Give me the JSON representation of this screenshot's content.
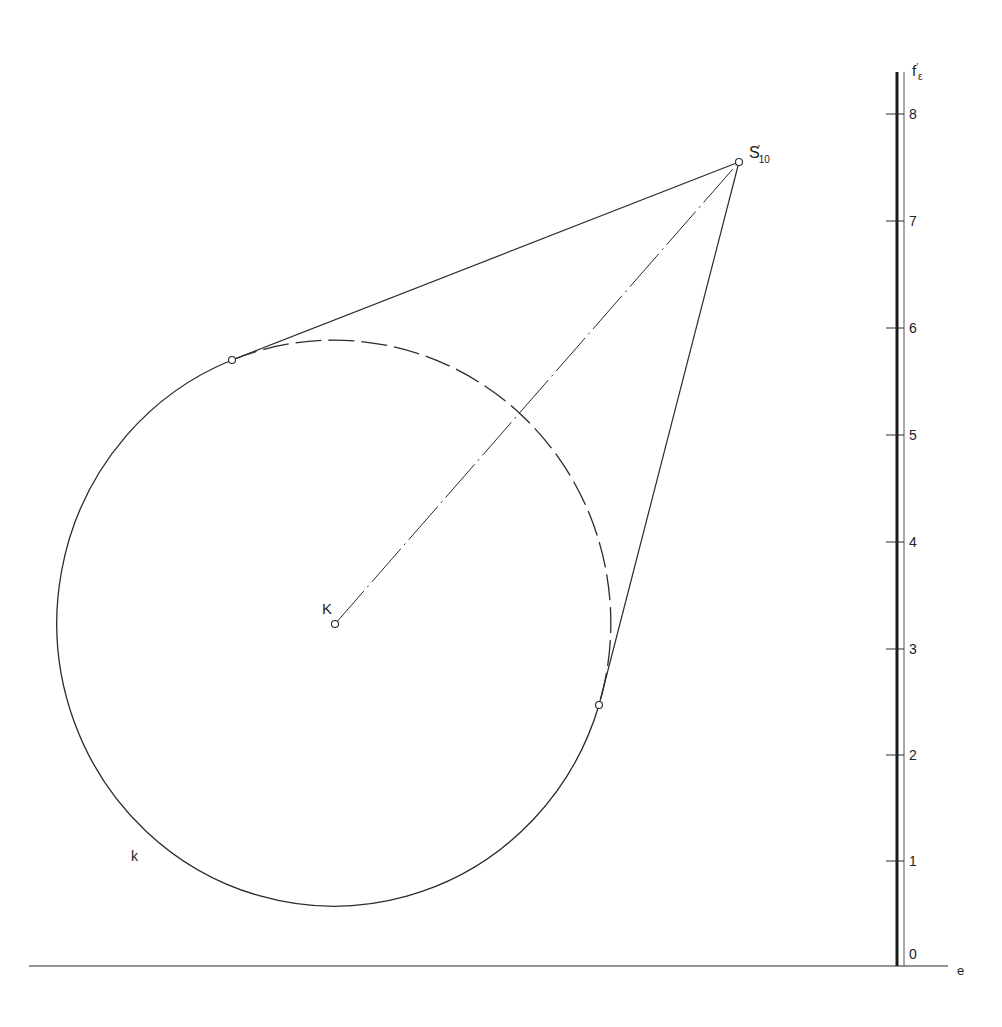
{
  "diagram": {
    "colors": {
      "line": "#2a2a2a",
      "background": "#ffffff"
    },
    "circle": {
      "label": "k",
      "center_label": "K",
      "cx": 335,
      "cy": 624,
      "rx": 277,
      "ry": 283
    },
    "apex": {
      "label_main": "S",
      "label_prime": "′",
      "label_sub": "10",
      "x": 739,
      "y": 162
    },
    "tangent_points": [
      {
        "x": 232,
        "y": 360
      },
      {
        "x": 599,
        "y": 705
      }
    ],
    "axis": {
      "label_main": "f",
      "label_prime": "′",
      "label_sub": "ε",
      "baseline_label": "e",
      "ticks": [
        {
          "value": "0",
          "y": 967
        },
        {
          "value": "1",
          "y": 861
        },
        {
          "value": "2",
          "y": 755
        },
        {
          "value": "3",
          "y": 649
        },
        {
          "value": "4",
          "y": 542
        },
        {
          "value": "5",
          "y": 435
        },
        {
          "value": "6",
          "y": 328
        },
        {
          "value": "7",
          "y": 221
        },
        {
          "value": "8",
          "y": 114
        }
      ]
    }
  }
}
